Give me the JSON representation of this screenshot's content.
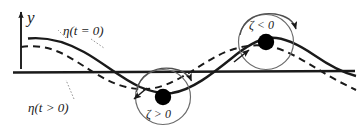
{
  "figure": {
    "kind": "wave-kinematics-diagram",
    "background_color": "#ffffff",
    "stroke_color": "#1a1a1a",
    "dot_color": "#000000",
    "circle_color": "#595959",
    "width": 361,
    "height": 138
  },
  "axes": {
    "vertical_axis_label": "y",
    "vertical_axis_name": "y-axis-arrow",
    "baseline_name": "mean-water-level-line"
  },
  "labels": {
    "eta_t_equals_0": "η(t = 0)",
    "eta_t_greater_0": "η(t > 0)",
    "zeta_greater_0": "ζ > 0",
    "zeta_less_0": "ζ < 0"
  },
  "curves": [
    {
      "name": "eta-t-equals-0-curve",
      "style": "solid",
      "label": "η(t = 0)"
    },
    {
      "name": "eta-t-greater-0-curve",
      "style": "dashed",
      "label": "η(t > 0)"
    }
  ],
  "particles": [
    {
      "name": "particle-trough",
      "zeta_sign_label": "ζ > 0",
      "position": "wave-trough",
      "rotation_sense": "clockwise"
    },
    {
      "name": "particle-crest",
      "zeta_sign_label": "ζ < 0",
      "position": "wave-crest",
      "rotation_sense": "clockwise"
    }
  ]
}
